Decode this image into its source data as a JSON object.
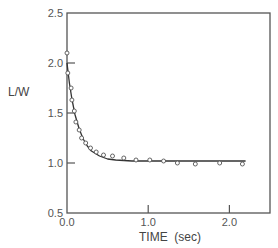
{
  "chart_data": {
    "type": "scatter",
    "title": "",
    "xlabel": "TIME (sec)",
    "ylabel": "L/W",
    "xlim": [
      0.0,
      2.5
    ],
    "ylim": [
      0.5,
      2.5
    ],
    "grid": false,
    "legend": null,
    "x_ticks": [
      0.0,
      1.0,
      2.0
    ],
    "x_tick_labels": [
      "0.0",
      "1.0",
      "2.0"
    ],
    "y_ticks": [
      0.5,
      1.0,
      1.5,
      2.0,
      2.5
    ],
    "y_tick_labels": [
      "0.5",
      "1.0",
      "1.5",
      "2.0",
      "2.5"
    ],
    "series": [
      {
        "name": "measured",
        "style": "open-circle",
        "x": [
          0.0,
          0.01,
          0.05,
          0.06,
          0.09,
          0.11,
          0.15,
          0.18,
          0.23,
          0.29,
          0.36,
          0.45,
          0.56,
          0.7,
          0.85,
          1.02,
          1.19,
          1.36,
          1.58,
          1.88,
          2.16
        ],
        "y": [
          2.1,
          1.9,
          1.75,
          1.63,
          1.52,
          1.41,
          1.33,
          1.25,
          1.2,
          1.15,
          1.11,
          1.08,
          1.07,
          1.05,
          1.03,
          1.03,
          1.02,
          1.0,
          0.99,
          1.0,
          0.99
        ]
      },
      {
        "name": "fit",
        "style": "solid-line",
        "x": [
          0.0,
          0.03,
          0.06,
          0.1,
          0.15,
          0.2,
          0.25,
          0.3,
          0.4,
          0.5,
          0.6,
          0.8,
          1.0,
          1.5,
          2.0,
          2.2
        ],
        "y": [
          2.0,
          1.8,
          1.64,
          1.48,
          1.34,
          1.24,
          1.17,
          1.12,
          1.07,
          1.04,
          1.03,
          1.02,
          1.02,
          1.02,
          1.02,
          1.02
        ]
      }
    ]
  },
  "axes": {
    "x_title": "TIME  (sec)",
    "y_title": "L/W"
  }
}
